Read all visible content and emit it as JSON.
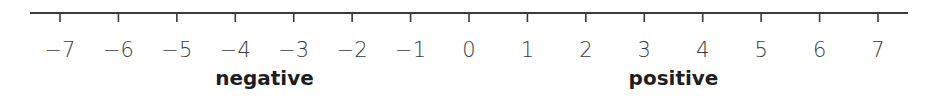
{
  "number_line": {
    "min": -7,
    "max": 7,
    "step": 1,
    "tick_labels": [
      "−7",
      "−6",
      "−5",
      "−4",
      "−3",
      "−2",
      "−1",
      "0",
      "1",
      "2",
      "3",
      "4",
      "5",
      "6",
      "7"
    ],
    "regions": [
      {
        "label": "negative",
        "center_value": -3.5
      },
      {
        "label": "positive",
        "center_value": 3.5
      }
    ],
    "line_color": "#3a3a3a",
    "text_color": "#1e1e1e"
  }
}
